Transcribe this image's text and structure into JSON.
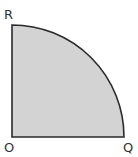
{
  "diagram": {
    "type": "quarter-circle sector",
    "labels": {
      "top": "R",
      "origin": "O",
      "right": "Q"
    },
    "colors": {
      "fill": "#d3d3d3",
      "stroke": "#2a2a2a",
      "background": "#ffffff"
    }
  }
}
